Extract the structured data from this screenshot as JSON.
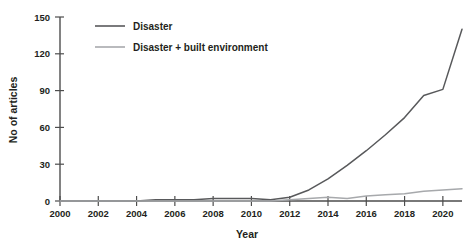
{
  "chart_data": {
    "type": "line",
    "title": "",
    "xlabel": "Year",
    "ylabel": "No of articles",
    "xlim": [
      2000,
      2021
    ],
    "ylim": [
      0,
      150
    ],
    "grid": false,
    "legend_position": "top-left",
    "x": [
      2000,
      2001,
      2002,
      2003,
      2004,
      2005,
      2006,
      2007,
      2008,
      2009,
      2010,
      2011,
      2012,
      2013,
      2014,
      2015,
      2016,
      2017,
      2018,
      2019,
      2020,
      2021
    ],
    "xticks": [
      "2000",
      "2002",
      "2004",
      "2006",
      "2008",
      "2010",
      "2012",
      "2014",
      "2016",
      "2018",
      "2020"
    ],
    "xtick_values": [
      2000,
      2002,
      2004,
      2006,
      2008,
      2010,
      2012,
      2014,
      2016,
      2018,
      2020
    ],
    "yticks": [
      "0",
      "30",
      "60",
      "90",
      "120",
      "150"
    ],
    "ytick_values": [
      0,
      30,
      60,
      90,
      120,
      150
    ],
    "series": [
      {
        "name": "Disaster",
        "color": "#58595b",
        "values": [
          0,
          0,
          0,
          0,
          0,
          1,
          1,
          1,
          2,
          2,
          2,
          1,
          3,
          9,
          18,
          29,
          41,
          54,
          68,
          86,
          91,
          140
        ]
      },
      {
        "name": "Disaster + built environment",
        "color": "#a7a9ac",
        "values": [
          0,
          0,
          0,
          0,
          0,
          0,
          0,
          0,
          0,
          0,
          0,
          0,
          1,
          2,
          3,
          2,
          4,
          5,
          6,
          8,
          9,
          10
        ]
      }
    ]
  },
  "legend": {
    "items": [
      {
        "label": "Disaster",
        "color": "#58595b"
      },
      {
        "label": "Disaster + built environment",
        "color": "#a7a9ac"
      }
    ]
  },
  "axes": {
    "x_title": "Year",
    "y_title": "No of articles"
  }
}
